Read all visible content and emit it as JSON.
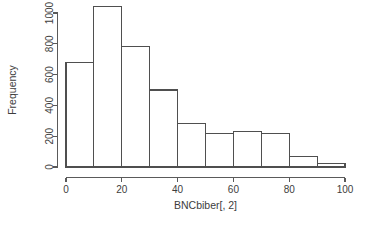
{
  "chart_data": {
    "type": "bar",
    "title": "",
    "xlabel": "BNCbiber[, 2]",
    "ylabel": "Frequency",
    "grid": false,
    "legend": false,
    "bin_width": 10,
    "bin_edges": [
      0,
      10,
      20,
      30,
      40,
      50,
      60,
      70,
      80,
      90,
      100
    ],
    "categories": [
      "0-10",
      "10-20",
      "20-30",
      "30-40",
      "40-50",
      "50-60",
      "60-70",
      "70-80",
      "80-90",
      "90-100"
    ],
    "values": [
      680,
      1040,
      785,
      500,
      285,
      220,
      230,
      220,
      70,
      20
    ],
    "x": [
      5,
      15,
      25,
      35,
      45,
      55,
      65,
      75,
      85,
      95
    ],
    "xlim": [
      0,
      100
    ],
    "ylim": [
      0,
      1000
    ],
    "xticks": [
      0,
      20,
      40,
      60,
      80,
      100
    ],
    "xtick_labels": [
      "0",
      "20",
      "40",
      "60",
      "80",
      "100"
    ],
    "yticks": [
      0,
      200,
      400,
      600,
      800,
      1000
    ],
    "ytick_labels": [
      "0",
      "200",
      "400",
      "600",
      "800",
      "1000"
    ],
    "colors": {
      "bar_fill": "#ffffff",
      "bar_stroke": "#4f4f4f",
      "axis": "#5a5a5a",
      "text": "#3d3d3d",
      "background": "#ffffff"
    }
  }
}
